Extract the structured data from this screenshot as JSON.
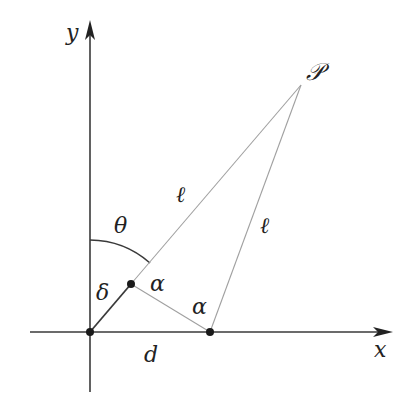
{
  "diagram": {
    "axes": {
      "x_label": "x",
      "y_label": "y",
      "origin": [
        90,
        332
      ],
      "x_end": [
        392,
        332
      ],
      "y_end": [
        90,
        22
      ]
    },
    "points": {
      "origin": [
        90,
        332
      ],
      "delta_end": [
        131,
        284
      ],
      "d_point": [
        210,
        332
      ],
      "P": [
        301,
        85
      ]
    },
    "labels": {
      "P": "𝒫",
      "ell_1": "ℓ",
      "ell_2": "ℓ",
      "theta": "θ",
      "delta": "δ",
      "alpha_1": "α",
      "alpha_2": "α",
      "d": "d"
    },
    "colors": {
      "axis": "#3a3a3a",
      "thin_line": "#9a9a9a",
      "dot": "#1a1a1a",
      "text": "#222222"
    }
  }
}
